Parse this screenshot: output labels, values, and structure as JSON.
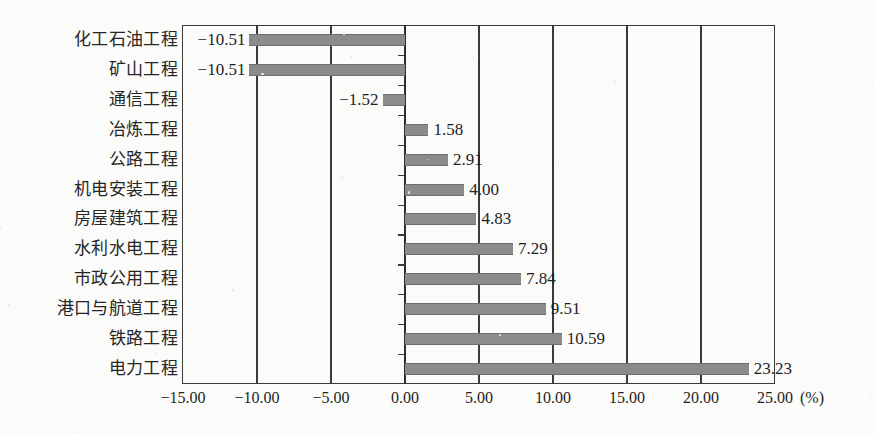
{
  "chart_data": {
    "type": "bar",
    "orientation": "horizontal",
    "title": "",
    "xlabel": "(%)",
    "ylabel": "",
    "unit": "(%)",
    "grid": true,
    "legend": "none",
    "xlim": [
      -15.0,
      25.0
    ],
    "xticks": [
      "-15.00",
      "-10.00",
      "-5.00",
      "0.00",
      "5.00",
      "10.00",
      "15.00",
      "20.00",
      "25.00"
    ],
    "xtick_values": [
      -15.0,
      -10.0,
      -5.0,
      0.0,
      5.0,
      10.0,
      15.0,
      20.0,
      25.0
    ],
    "categories": [
      "化工石油工程",
      "矿山工程",
      "通信工程",
      "冶炼工程",
      "公路工程",
      "机电安装工程",
      "房屋建筑工程",
      "水利水电工程",
      "市政公用工程",
      "港口与航道工程",
      "铁路工程",
      "电力工程"
    ],
    "values": [
      -10.51,
      -10.51,
      -1.52,
      1.58,
      2.91,
      4.0,
      4.83,
      7.29,
      7.84,
      9.51,
      10.59,
      23.23
    ],
    "value_labels": [
      "-10.51",
      "-10.51",
      "-1.52",
      "1.58",
      "2.91",
      "4.00",
      "4.83",
      "7.29",
      "7.84",
      "9.51",
      "10.59",
      "23.23"
    ],
    "bar_color": "#8b8b8b",
    "axis_color": "#3a3a3a",
    "background_color": "#fbfbfa"
  },
  "caption": {
    "text": ""
  }
}
